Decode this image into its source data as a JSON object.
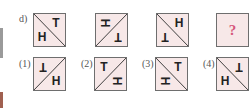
{
  "question": {
    "label": "d)",
    "sequence": [
      {
        "diagonal": "\\",
        "top_glyph": "T",
        "top_pos": "top-right",
        "top_rot": 0,
        "bottom_glyph": "H",
        "bottom_pos": "bottom-left",
        "bottom_rot": 0
      },
      {
        "diagonal": "/",
        "top_glyph": "H",
        "top_pos": "top-left",
        "top_rot": 90,
        "bottom_glyph": "T",
        "bottom_pos": "bottom-right",
        "bottom_rot": 180
      },
      {
        "diagonal": "\\",
        "top_glyph": "H",
        "top_pos": "top-right",
        "top_rot": 0,
        "bottom_glyph": "T",
        "bottom_pos": "bottom-left",
        "bottom_rot": 180
      },
      {
        "unknown": "?"
      }
    ]
  },
  "options": [
    {
      "label": "(1)",
      "diagonal": "/",
      "top_glyph": "T",
      "top_pos": "top-left",
      "top_rot": 180,
      "bottom_glyph": "H",
      "bottom_pos": "bottom-right",
      "bottom_rot": 0
    },
    {
      "label": "(2)",
      "diagonal": "/",
      "top_glyph": "T",
      "top_pos": "top-left",
      "top_rot": 0,
      "bottom_glyph": "H",
      "bottom_pos": "bottom-right",
      "bottom_rot": 90
    },
    {
      "label": "(3)",
      "diagonal": "\\",
      "top_glyph": "T",
      "top_pos": "top-right",
      "top_rot": 0,
      "bottom_glyph": "H",
      "bottom_pos": "bottom-left",
      "bottom_rot": 90
    },
    {
      "label": "(4)",
      "diagonal": "\\",
      "top_glyph": "T",
      "top_pos": "top-right",
      "top_rot": 180,
      "bottom_glyph": "H",
      "bottom_pos": "bottom-left",
      "bottom_rot": 0
    }
  ],
  "colors": {
    "border": "#6e6e6e",
    "fill": "#f7e8e8",
    "question_mark": "#d6577c"
  }
}
